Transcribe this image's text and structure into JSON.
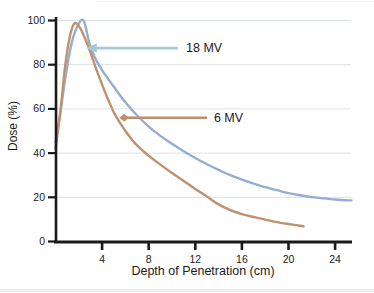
{
  "figure": {
    "y_axis_label": "Dose (%)",
    "x_axis_label": "Depth of Penetration (cm)"
  },
  "colors": {
    "background": "#ffffff",
    "axis": "#1a1a1a",
    "grid": "#dde2e7",
    "tick_text": "#1b1b1b",
    "curve_18mv": "#94add2",
    "curve_6mv": "#bf916e",
    "arrow_18mv": "#a6c8d9",
    "arrow_6mv": "#bb8e6d"
  },
  "chart_data": {
    "type": "line",
    "title": "",
    "xlabel": "Depth of Penetration (cm)",
    "ylabel": "Dose (%)",
    "xlim": [
      0,
      25.5
    ],
    "ylim": [
      0,
      100
    ],
    "x_ticks": [
      4,
      8,
      12,
      16,
      20,
      24
    ],
    "y_ticks": [
      0,
      20,
      40,
      60,
      80,
      100
    ],
    "grid": "horizontal-only",
    "legend_position": "none",
    "series": [
      {
        "name": "18 MV",
        "color": "#94add2",
        "points": [
          [
            0,
            45
          ],
          [
            0.4,
            58
          ],
          [
            0.9,
            76
          ],
          [
            1.4,
            90
          ],
          [
            1.9,
            97.5
          ],
          [
            2.4,
            100
          ],
          [
            2.9,
            90
          ],
          [
            3.4,
            83
          ],
          [
            4,
            77.5
          ],
          [
            5,
            70
          ],
          [
            6,
            63
          ],
          [
            7,
            57
          ],
          [
            8,
            52
          ],
          [
            9,
            47.8
          ],
          [
            10,
            44.2
          ],
          [
            11,
            40.8
          ],
          [
            12,
            37.8
          ],
          [
            13,
            35
          ],
          [
            14,
            32.4
          ],
          [
            15,
            30
          ],
          [
            16,
            28
          ],
          [
            17,
            26.2
          ],
          [
            18,
            24.6
          ],
          [
            19,
            23.2
          ],
          [
            20,
            21.9
          ],
          [
            21,
            20.9
          ],
          [
            22,
            20.1
          ],
          [
            23,
            19.5
          ],
          [
            24,
            19
          ],
          [
            25,
            18.7
          ],
          [
            25.4,
            18.6
          ]
        ]
      },
      {
        "name": "6 MV",
        "color": "#bf916e",
        "points": [
          [
            0,
            42
          ],
          [
            0.4,
            58
          ],
          [
            0.8,
            78
          ],
          [
            1.2,
            92
          ],
          [
            1.6,
            98.5
          ],
          [
            2,
            97.5
          ],
          [
            2.4,
            93.5
          ],
          [
            2.9,
            87
          ],
          [
            3.4,
            79.5
          ],
          [
            4,
            71
          ],
          [
            4.5,
            64.5
          ],
          [
            5,
            58.5
          ],
          [
            5.5,
            54
          ],
          [
            6,
            50
          ],
          [
            6.5,
            46.5
          ],
          [
            7,
            43.5
          ],
          [
            8,
            38.8
          ],
          [
            9,
            34.8
          ],
          [
            10,
            31
          ],
          [
            11,
            27.4
          ],
          [
            12,
            23.8
          ],
          [
            13,
            20.3
          ],
          [
            14,
            16.8
          ],
          [
            15,
            14.2
          ],
          [
            16,
            12.4
          ],
          [
            17,
            11.1
          ],
          [
            18,
            9.9
          ],
          [
            19,
            8.8
          ],
          [
            20,
            7.9
          ],
          [
            21,
            7.1
          ],
          [
            21.3,
            6.9
          ]
        ]
      }
    ],
    "annotations": [
      {
        "label": "18 MV",
        "arrow_color": "#a6c8d9",
        "head": "triangle",
        "y_percent": 87.5,
        "tip_cm": 2.6,
        "tail_cm": 10.5,
        "label_cm": 11.2
      },
      {
        "label": "6 MV",
        "arrow_color": "#bb8e6d",
        "head": "diamond",
        "y_percent": 56,
        "tip_cm": 5.9,
        "tail_cm": 13.0,
        "label_cm": 13.6
      }
    ]
  }
}
